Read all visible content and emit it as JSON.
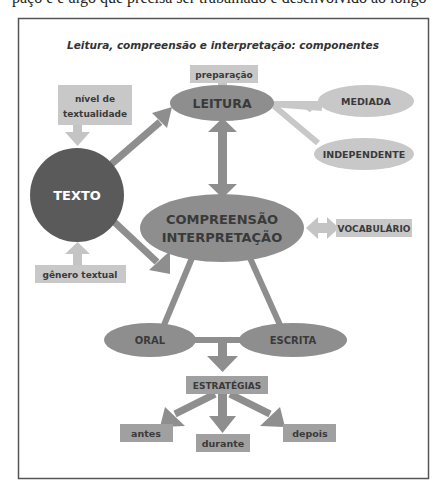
{
  "top_fragment": "paço e é algo que precisa ser trabalhado e desenvolvido ao longo",
  "diagram": {
    "title": "Leitura, compreensão e interpretação: componentes",
    "nodes": {
      "texto": "TEXTO",
      "leitura": "LEITURA",
      "preparacao": "preparação",
      "nivel_line1": "nível de",
      "nivel_line2": "textualidade",
      "genero": "gênero textual",
      "mediada": "MEDIADA",
      "independente": "INDEPENDENTE",
      "compreensao": "COMPREENSÃO",
      "interpretacao": "INTERPRETAÇÃO",
      "vocabulario": "VOCABULÁRIO",
      "oral": "ORAL",
      "escrita": "ESCRITA",
      "estrategias": "ESTRATÉGIAS",
      "antes": "antes",
      "durante": "durante",
      "depois": "depois"
    },
    "colors": {
      "dark_node": "#5a5a5a",
      "mid_node": "#8e8e8e",
      "light_node": "#c8c8c8",
      "box_mid": "#a0a0a0",
      "arrow_mid": "#8e8e8e",
      "arrow_light": "#c4c4c4",
      "frame": "#555555"
    }
  }
}
